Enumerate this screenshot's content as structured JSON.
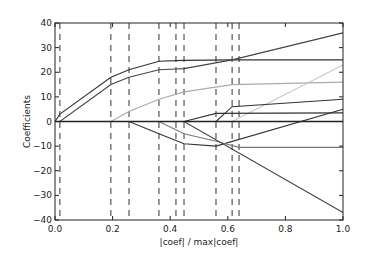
{
  "chart_data": {
    "type": "line",
    "title": "",
    "xlabel": "|coef| / max|coef|",
    "ylabel": "Coefficients",
    "xlim": [
      0.0,
      1.0
    ],
    "ylim": [
      -40,
      40
    ],
    "xticks": [
      0.0,
      0.2,
      0.4,
      0.6,
      0.8,
      1.0
    ],
    "xtick_labels": [
      "0.0",
      "0.2",
      "0.4",
      "0.6",
      "0.8",
      "1.0"
    ],
    "yticks": [
      40,
      30,
      20,
      10,
      0,
      -10,
      -20,
      -30,
      -40
    ],
    "ytick_labels": [
      "40",
      "30",
      "20",
      "10",
      "0",
      "−10",
      "−20",
      "−30",
      "−40"
    ],
    "grid": false,
    "legend": "none",
    "vlines": [
      0.017,
      0.194,
      0.257,
      0.361,
      0.42,
      0.448,
      0.559,
      0.615,
      0.639
    ],
    "series": [
      {
        "name": "coef-1",
        "color": "#333333",
        "x": [
          0,
          0.017,
          0.194,
          0.257,
          0.361,
          0.448,
          0.615,
          1.0
        ],
        "y": [
          0,
          3,
          18,
          21,
          24.5,
          24.8,
          25,
          25
        ]
      },
      {
        "name": "coef-2",
        "color": "#444444",
        "x": [
          0,
          0.017,
          0.194,
          0.257,
          0.361,
          0.42,
          0.448,
          0.615,
          1.0
        ],
        "y": [
          0,
          0,
          15,
          18,
          21,
          21.3,
          21.5,
          25,
          36
        ]
      },
      {
        "name": "coef-3",
        "color": "#aaaaaa",
        "x": [
          0,
          0.194,
          0.257,
          0.361,
          0.448,
          0.615,
          1.0
        ],
        "y": [
          0,
          0,
          4,
          9,
          12,
          15,
          16
        ]
      },
      {
        "name": "coef-4",
        "color": "#c8c8c8",
        "x": [
          0,
          0.615,
          1.0
        ],
        "y": [
          0,
          0,
          23
        ]
      },
      {
        "name": "coef-5",
        "color": "#333333",
        "x": [
          0,
          0.448,
          0.559,
          1.0
        ],
        "y": [
          0,
          0,
          3.3,
          3.5
        ]
      },
      {
        "name": "coef-6",
        "color": "#333333",
        "x": [
          0,
          0.559,
          0.615,
          1.0
        ],
        "y": [
          0,
          0,
          6,
          9
        ]
      },
      {
        "name": "coef-7",
        "color": "#333333",
        "x": [
          0,
          0.257,
          0.361,
          0.448,
          0.559,
          1.0
        ],
        "y": [
          0,
          0,
          -5,
          -9,
          -10,
          5
        ]
      },
      {
        "name": "coef-8",
        "color": "#777777",
        "x": [
          0,
          0.361,
          0.448,
          0.559,
          0.639,
          1.0
        ],
        "y": [
          0,
          0,
          -5,
          -8,
          -10.5,
          -10.5
        ]
      },
      {
        "name": "coef-9",
        "color": "#444444",
        "x": [
          0,
          0.448,
          1.0
        ],
        "y": [
          0,
          0,
          -37
        ]
      },
      {
        "name": "coef-zero",
        "color": "#222222",
        "x": [
          0,
          1.0
        ],
        "y": [
          0,
          0
        ]
      }
    ]
  }
}
